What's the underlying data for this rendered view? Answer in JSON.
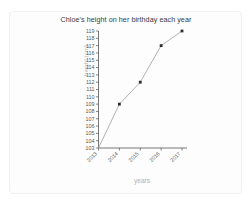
{
  "chart_data": {
    "type": "line",
    "title": "Chloe's height on her birthday each year",
    "xlabel": "years",
    "ylabel": "height (cm)",
    "categories": [
      "2013",
      "2014",
      "2015",
      "2016",
      "2017"
    ],
    "values": [
      103,
      109,
      112,
      117,
      119
    ],
    "ylim": [
      103,
      119
    ],
    "yticks": [
      103,
      104,
      105,
      106,
      107,
      108,
      109,
      110,
      111,
      112,
      113,
      114,
      115,
      116,
      117,
      118,
      119
    ],
    "grid": false,
    "legend": null,
    "marker": "square",
    "line_color": "#9a9a9a",
    "marker_color": "#2b2b2b",
    "title_color": "#3a3a3a",
    "axis_label_color": "#b4b4b4"
  }
}
